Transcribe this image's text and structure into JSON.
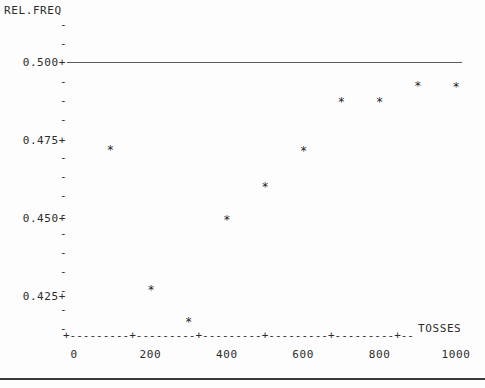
{
  "chart_data": {
    "type": "scatter",
    "title": "",
    "ylabel": "REL.FREQ",
    "xlabel": "TOSSES",
    "x": [
      95,
      202,
      300,
      400,
      500,
      601,
      700,
      800,
      900,
      1000
    ],
    "values": [
      0.4727,
      0.428,
      0.4175,
      0.4503,
      0.4609,
      0.4724,
      0.4882,
      0.4882,
      0.4933,
      0.493
    ],
    "point_marker": "*",
    "xlim": [
      0,
      1060
    ],
    "ylim": [
      0.4175,
      0.5055
    ],
    "grid": false,
    "legend": false,
    "reference_line": {
      "value": 0.5,
      "orientation": "horizontal",
      "style": "solid",
      "color": "#5a5a5a"
    },
    "y_tick_labels": [
      "0.500+",
      "0.475+",
      "0.450+",
      "0.425+"
    ],
    "y_tick_values": [
      0.5,
      0.475,
      0.45,
      0.425
    ],
    "y_minor_tick_mark": "-",
    "x_tick_labels": [
      "0",
      "200",
      "400",
      "600",
      "800",
      "1000"
    ],
    "x_tick_values": [
      0,
      200,
      400,
      600,
      800,
      1000
    ],
    "x_axis_line": "+---------+---------+---------+---------+---------+--"
  },
  "axes": {
    "y_title": "REL.FREQ",
    "x_title": "TOSSES"
  },
  "colors": {
    "background": "#fdfdfd",
    "text": "#2b2b2b",
    "marker": "#1f1f1f",
    "reference_line": "#5a5a5a",
    "rule": "#3c3c3c"
  }
}
